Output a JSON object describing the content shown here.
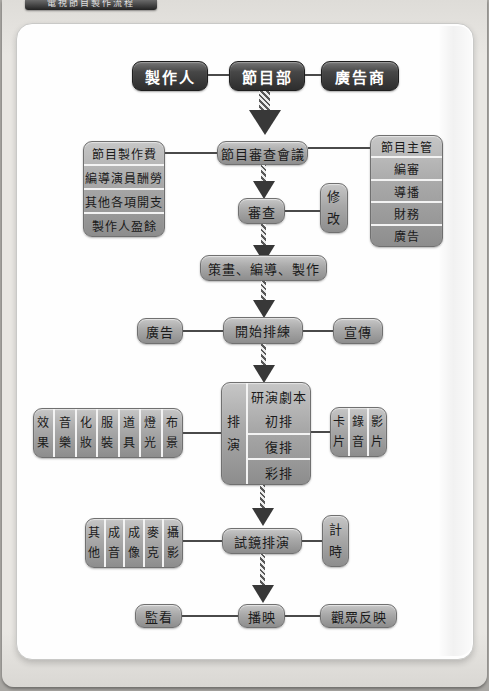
{
  "page": {
    "tab_label": "電視節目製作流程"
  },
  "colors": {
    "dark_node": "#3d3d3d",
    "gray_node": "#a8a8a8",
    "connector": "#4a4a4a",
    "page_bg": "#e9e7e3",
    "card_bg": "#fefefe"
  },
  "flowchart": {
    "producer": "製作人",
    "program_dept": "節目部",
    "advertiser": "廣告商",
    "budget_stack": [
      "節目製作費",
      "編導演員酬勞",
      "其他各項開支",
      "製作人盈餘"
    ],
    "review_meeting": "節目審查會議",
    "supervisor_stack": [
      "節目主管",
      "編審",
      "導播",
      "財務",
      "廣告"
    ],
    "review": "審查",
    "revise": "修\n改",
    "planning": "策畫、編導、製作",
    "ad": "廣告",
    "rehearsal_start": "開始排練",
    "publicity": "宣傳",
    "crafts_columns": [
      "效\n果",
      "音\n樂",
      "化\n妝",
      "服\n裝",
      "道\n具",
      "燈\n光",
      "布\n景"
    ],
    "rehearsal_side": "排\n演",
    "rehearsal_rows": [
      "研演劇本",
      "初排",
      "復排",
      "彩排"
    ],
    "media_columns": [
      "卡\n片",
      "錄\n音",
      "影\n片"
    ],
    "tech_columns": [
      "其\n他",
      "成\n音",
      "成\n像",
      "麥\n克",
      "攝\n影"
    ],
    "camera_rehearsal": "試鏡排演",
    "timing": "計\n時",
    "monitor": "監看",
    "broadcast": "播映",
    "audience_feedback": "觀眾反映"
  }
}
